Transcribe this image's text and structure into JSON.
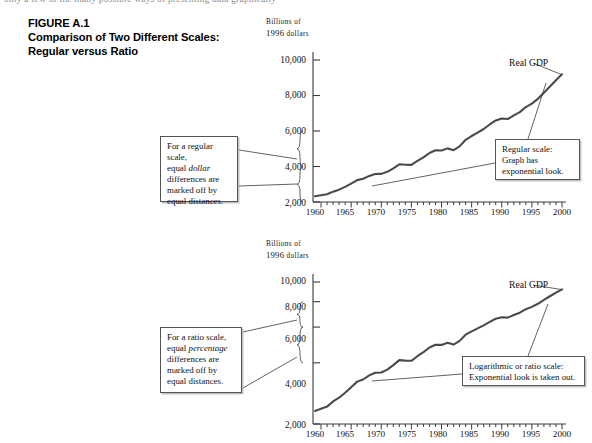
{
  "page": {
    "cropped_running_text": "only a few of the many possible ways of presenting data graphically",
    "figure_number": "FIGURE A.1",
    "figure_title_line1": "Comparison of Two Different Scales:",
    "figure_title_line2": "Regular versus Ratio"
  },
  "panels": {
    "top": {
      "axis_title_line1": "Billions of",
      "axis_title_line2_num": "1996 ",
      "axis_title_line2_word": "dollars",
      "scale_type": "linear",
      "series_label": "Real GDP",
      "y_ticks": [
        "2,000",
        "4,000",
        "6,000",
        "8,000",
        "10,000"
      ],
      "x_ticks": [
        "1960",
        "1965",
        "1970",
        "1975",
        "1980",
        "1985",
        "1990",
        "1995",
        "2000"
      ],
      "callout_left": {
        "l1": "For a regular scale,",
        "l2a": "equal ",
        "l2b": "dollar",
        "l3": "differences are",
        "l4": "marked off by",
        "l5": "equal distances."
      },
      "callout_right": {
        "l1": "Regular scale:",
        "l2": "Graph has",
        "l3": "exponential look."
      }
    },
    "bottom": {
      "axis_title_line1": "Billions of",
      "axis_title_line2_num": "1996 ",
      "axis_title_line2_word": "dollars",
      "scale_type": "logarithmic",
      "series_label": "Real GDP",
      "y_ticks": [
        "2,000",
        "4,000",
        "6,000",
        "8,000",
        "10,000"
      ],
      "x_ticks": [
        "1960",
        "1965",
        "1970",
        "1975",
        "1980",
        "1985",
        "1990",
        "1995",
        "2000"
      ],
      "callout_left": {
        "l1": "For a ratio scale,",
        "l2a": "equal ",
        "l2b": "percentage",
        "l3": "differences are",
        "l4": "marked off by",
        "l5": "equal distances."
      },
      "callout_right": {
        "l1": "Logarithmic or ratio scale:",
        "l2": "Exponential look is taken out."
      }
    }
  },
  "colors": {
    "line": "#4a4a4a",
    "axis": "#3a3a3a",
    "callout_border": "#555555",
    "text": "#111111",
    "background": "#ffffff"
  },
  "chart_data": {
    "type": "line",
    "title": "Comparison of Two Different Scales: Regular versus Ratio",
    "xlabel": "",
    "ylabel": "Billions of 1996 dollars",
    "grid": false,
    "legend": "none",
    "panels": [
      {
        "name": "Regular (linear) scale",
        "yscale": "linear",
        "ylim": [
          2000,
          10000
        ],
        "xlim": [
          1959,
          2000
        ],
        "yticks": [
          2000,
          4000,
          6000,
          8000,
          10000
        ],
        "xticks": [
          1960,
          1965,
          1970,
          1975,
          1980,
          1985,
          1990,
          1995,
          2000
        ]
      },
      {
        "name": "Ratio (logarithmic) scale",
        "yscale": "log",
        "ylim": [
          2000,
          10000
        ],
        "xlim": [
          1959,
          2000
        ],
        "yticks": [
          2000,
          4000,
          6000,
          8000,
          10000
        ],
        "xticks": [
          1960,
          1965,
          1970,
          1975,
          1980,
          1985,
          1990,
          1995,
          2000
        ]
      }
    ],
    "series": [
      {
        "name": "Real GDP",
        "x": [
          1959,
          1960,
          1961,
          1962,
          1963,
          1964,
          1965,
          1966,
          1967,
          1968,
          1969,
          1970,
          1971,
          1972,
          1973,
          1974,
          1975,
          1976,
          1977,
          1978,
          1979,
          1980,
          1981,
          1982,
          1983,
          1984,
          1985,
          1986,
          1987,
          1988,
          1989,
          1990,
          1991,
          1992,
          1993,
          1994,
          1995,
          1996,
          1997,
          1998,
          1999,
          2000
        ],
        "values": [
          2319,
          2377,
          2436,
          2583,
          2695,
          2851,
          3035,
          3233,
          3312,
          3471,
          3578,
          3585,
          3702,
          3899,
          4124,
          4100,
          4093,
          4312,
          4511,
          4761,
          4913,
          4901,
          5021,
          4919,
          5132,
          5505,
          5717,
          5912,
          6113,
          6368,
          6592,
          6707,
          6676,
          6880,
          7063,
          7348,
          7544,
          7813,
          8160,
          8509,
          8859,
          9191
        ]
      }
    ]
  }
}
